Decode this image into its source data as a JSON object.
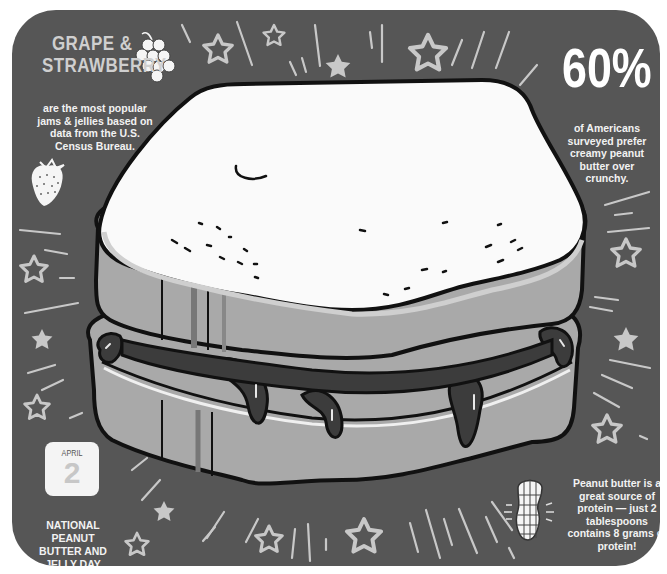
{
  "poster": {
    "background_color": "#565656",
    "accent_light": "#cfcfcf",
    "grape_fact": {
      "title": "GRAPE & STRAWBERRY",
      "title_line1": "GRAPE &",
      "title_line2": "STRAWBERRY",
      "description": "are the most popular jams & jellies based on data from the U.S. Census Bureau.",
      "icons": [
        "grapes-icon",
        "strawberry-icon"
      ]
    },
    "creamy_fact": {
      "stat": "60%",
      "description": "of Americans surveyed prefer creamy peanut butter over crunchy."
    },
    "date_card": {
      "month": "APRIL",
      "day": "2",
      "caption": "NATIONAL PEANUT BUTTER AND JELLY DAY"
    },
    "protein_fact": {
      "description": "Peanut butter is a great source of protein — just 2 tablespoons contains 8 grams of protein!",
      "icon": "peanut-icon"
    },
    "illustration": "peanut-butter-and-jelly-sandwich"
  }
}
